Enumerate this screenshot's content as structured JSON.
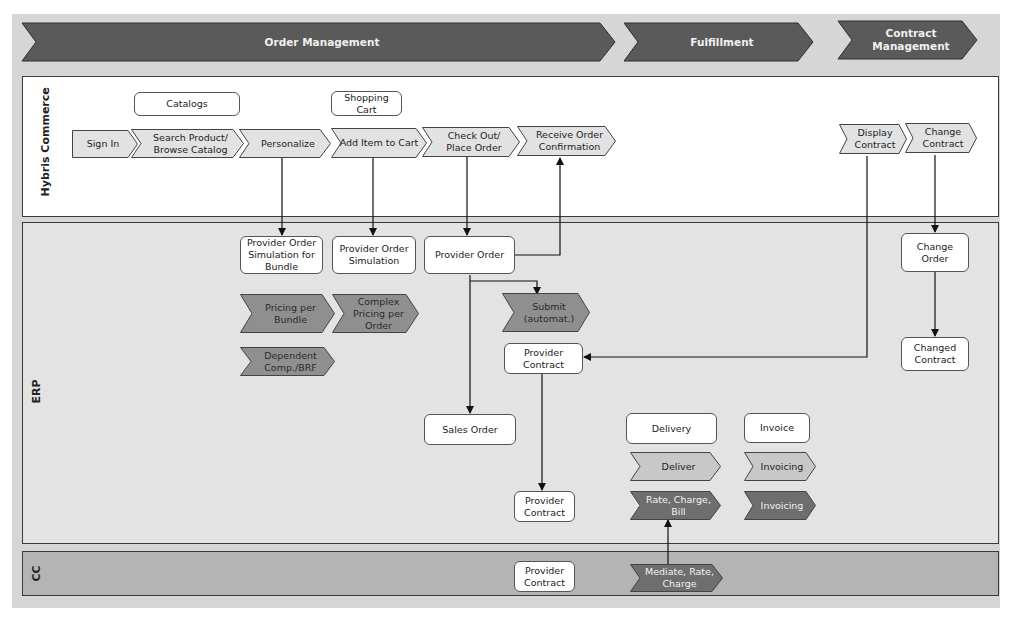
{
  "phases": [
    {
      "id": "order-management",
      "label": "Order Management"
    },
    {
      "id": "fulfillment",
      "label": "Fulfillment"
    },
    {
      "id": "contract-management",
      "label": "Contract\nManagement"
    }
  ],
  "lanes": {
    "hybris": "Hybris Commerce",
    "erp": "ERP",
    "cc": "CC"
  },
  "hybris": {
    "catalogs": "Catalogs",
    "shopping_cart": "Shopping\nCart",
    "steps": {
      "sign_in": "Sign In",
      "search_product": "Search Product/\nBrowse Catalog",
      "personalize": "Personalize",
      "add_item": "Add Item to Cart",
      "check_out": "Check Out/\nPlace Order",
      "receive_confirmation": "Receive Order\nConfirmation",
      "display_contract": "Display\nContract",
      "change_contract": "Change\nContract"
    }
  },
  "erp": {
    "provider_order_sim_bundle": "Provider Order\nSimulation for\nBundle",
    "provider_order_sim": "Provider Order\nSimulation",
    "provider_order": "Provider Order",
    "pricing_per_bundle": "Pricing per\nBundle",
    "complex_pricing": "Complex\nPricing per\nOrder",
    "dependent_comp": "Dependent\nComp./BRF",
    "submit_automat": "Submit\n(automat.)",
    "provider_contract_1": "Provider\nContract",
    "sales_order": "Sales Order",
    "provider_contract_2": "Provider\nContract",
    "delivery": "Delivery",
    "deliver": "Deliver",
    "rate_charge_bill": "Rate, Charge,\nBill",
    "invoice": "Invoice",
    "invoicing_1": "Invoicing",
    "invoicing_2": "Invoicing",
    "change_order": "Change\nOrder",
    "changed_contract": "Changed\nContract"
  },
  "cc": {
    "provider_contract": "Provider\nContract",
    "mediate_rate_charge": "Mediate, Rate,\nCharge"
  },
  "colors": {
    "phase_fill": "#5a5a5a",
    "light_chevron": "#e2e2e2",
    "dark_chevron": "#8f8f8f",
    "darker_chevron": "#6e6e6e",
    "hybris_bg": "#ffffff",
    "erp_bg": "#e3e3e3",
    "cc_bg": "#b4b4b4"
  }
}
